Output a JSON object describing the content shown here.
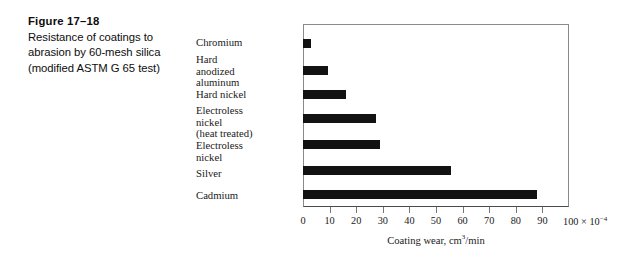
{
  "figure": {
    "number_label": "Figure 17–18",
    "caption": "Resistance of coatings to abrasion by 60-mesh silica (modified ASTM G 65 test)"
  },
  "chart_data": {
    "type": "bar",
    "orientation": "horizontal",
    "title": "",
    "xlabel": "Coating wear, cm³/min",
    "ylabel": "",
    "xlim": [
      0,
      100
    ],
    "xtick_values": [
      0,
      10,
      20,
      30,
      40,
      50,
      60,
      70,
      80,
      90,
      100
    ],
    "xtick_labels": [
      "0",
      "10",
      "20",
      "30",
      "40",
      "50",
      "60",
      "70",
      "80",
      "90",
      "100"
    ],
    "x_scale_note": "× 10⁻⁴",
    "x_last_tick_label": "100 × 10⁻⁴",
    "grid": false,
    "legend": false,
    "bar_color": "#121212",
    "categories": [
      "Chromium",
      "Hard\nanodized\naluminum",
      "Hard nickel",
      "Electroless\nnickel\n(heat treated)",
      "Electroless\nnickel",
      "Silver",
      "Cadmium"
    ],
    "values": [
      3,
      9.5,
      16,
      27.5,
      29,
      55.5,
      88
    ]
  }
}
